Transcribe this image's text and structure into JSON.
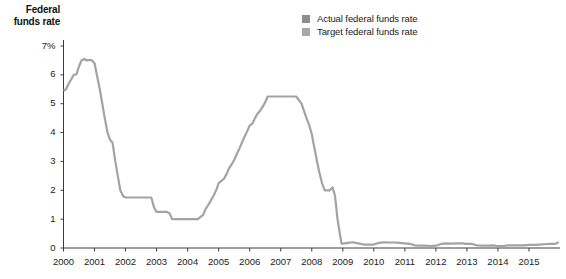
{
  "axis_title": {
    "line1": "Federal",
    "line2": "funds rate"
  },
  "legend": {
    "position": "top-right",
    "items": [
      {
        "label": "Actual federal funds rate",
        "color": "#8d8d8d"
      },
      {
        "label": "Target federal funds rate",
        "color": "#a8a8a8"
      }
    ]
  },
  "colors": {
    "line": "#a3a3a3",
    "axis": "#3c3c3c",
    "text": "#1a1a1a",
    "background": "#ffffff"
  },
  "chart_data": {
    "type": "line",
    "title": "",
    "subtitle": "",
    "xlabel": "",
    "ylabel": "Federal funds rate",
    "grid": false,
    "legend_position": "top-right",
    "xlim": [
      2000,
      2016
    ],
    "ylim": [
      0,
      7
    ],
    "yticks": [
      0,
      1,
      2,
      3,
      4,
      5,
      6,
      7
    ],
    "ytick_labels": [
      "0",
      "1",
      "2",
      "3",
      "4",
      "5",
      "6",
      "7%"
    ],
    "xticks": [
      2000,
      2001,
      2002,
      2003,
      2004,
      2005,
      2006,
      2007,
      2008,
      2009,
      2010,
      2011,
      2012,
      2013,
      2014,
      2015
    ],
    "xtick_labels": [
      "2000",
      "2001",
      "2002",
      "2003",
      "2004",
      "2005",
      "2006",
      "2007",
      "2008",
      "2009",
      "2010",
      "2011",
      "2012",
      "2013",
      "2014",
      "2015"
    ],
    "series": [
      {
        "name": "Actual federal funds rate",
        "color": "#a3a3a3",
        "x": [
          2000.0,
          2000.08,
          2000.17,
          2000.25,
          2000.33,
          2000.42,
          2000.5,
          2000.58,
          2000.67,
          2000.75,
          2000.83,
          2000.92,
          2001.0,
          2001.08,
          2001.17,
          2001.25,
          2001.33,
          2001.42,
          2001.5,
          2001.58,
          2001.67,
          2001.75,
          2001.83,
          2001.92,
          2002.0,
          2002.17,
          2002.33,
          2002.5,
          2002.67,
          2002.83,
          2002.92,
          2003.0,
          2003.17,
          2003.33,
          2003.42,
          2003.5,
          2003.67,
          2003.83,
          2003.92,
          2004.0,
          2004.17,
          2004.33,
          2004.5,
          2004.58,
          2004.67,
          2004.75,
          2004.83,
          2004.92,
          2005.0,
          2005.17,
          2005.25,
          2005.33,
          2005.42,
          2005.5,
          2005.58,
          2005.67,
          2005.75,
          2005.83,
          2005.92,
          2006.0,
          2006.08,
          2006.17,
          2006.25,
          2006.33,
          2006.42,
          2006.5,
          2006.58,
          2006.67,
          2006.75,
          2006.83,
          2006.92,
          2007.0,
          2007.17,
          2007.33,
          2007.5,
          2007.67,
          2007.75,
          2007.83,
          2007.92,
          2008.0,
          2008.08,
          2008.17,
          2008.25,
          2008.33,
          2008.42,
          2008.58,
          2008.67,
          2008.75,
          2008.83,
          2008.92,
          2008.96,
          2009.0,
          2009.17,
          2009.33,
          2009.5,
          2009.67,
          2009.83,
          2010.0,
          2010.17,
          2010.33,
          2010.5,
          2010.67,
          2010.83,
          2011.0,
          2011.17,
          2011.33,
          2011.5,
          2011.67,
          2011.83,
          2012.0,
          2012.17,
          2012.33,
          2012.5,
          2012.67,
          2012.83,
          2013.0,
          2013.17,
          2013.33,
          2013.5,
          2013.67,
          2013.83,
          2014.0,
          2014.17,
          2014.33,
          2014.5,
          2014.67,
          2014.83,
          2015.0,
          2015.17,
          2015.33,
          2015.5,
          2015.67,
          2015.83,
          2015.96
        ],
        "y": [
          5.45,
          5.5,
          5.7,
          5.85,
          6.0,
          6.02,
          6.3,
          6.5,
          6.55,
          6.5,
          6.52,
          6.5,
          6.4,
          5.98,
          5.5,
          5.0,
          4.5,
          4.0,
          3.75,
          3.65,
          3.0,
          2.5,
          2.0,
          1.8,
          1.75,
          1.75,
          1.75,
          1.75,
          1.75,
          1.75,
          1.4,
          1.25,
          1.25,
          1.25,
          1.2,
          1.0,
          1.0,
          1.0,
          1.0,
          1.0,
          1.0,
          1.0,
          1.15,
          1.35,
          1.5,
          1.65,
          1.8,
          2.0,
          2.25,
          2.4,
          2.55,
          2.75,
          2.9,
          3.05,
          3.25,
          3.45,
          3.65,
          3.85,
          4.05,
          4.25,
          4.3,
          4.5,
          4.65,
          4.75,
          4.9,
          5.05,
          5.25,
          5.25,
          5.25,
          5.25,
          5.25,
          5.25,
          5.25,
          5.25,
          5.25,
          5.0,
          4.75,
          4.5,
          4.25,
          3.95,
          3.5,
          3.0,
          2.6,
          2.25,
          2.0,
          2.0,
          2.1,
          1.8,
          1.0,
          0.4,
          0.15,
          0.15,
          0.18,
          0.2,
          0.16,
          0.12,
          0.12,
          0.12,
          0.18,
          0.2,
          0.19,
          0.19,
          0.18,
          0.16,
          0.14,
          0.09,
          0.08,
          0.08,
          0.07,
          0.08,
          0.14,
          0.16,
          0.15,
          0.16,
          0.16,
          0.14,
          0.14,
          0.09,
          0.08,
          0.08,
          0.09,
          0.07,
          0.07,
          0.09,
          0.09,
          0.09,
          0.09,
          0.11,
          0.11,
          0.12,
          0.13,
          0.14,
          0.14,
          0.2
        ]
      }
    ]
  }
}
